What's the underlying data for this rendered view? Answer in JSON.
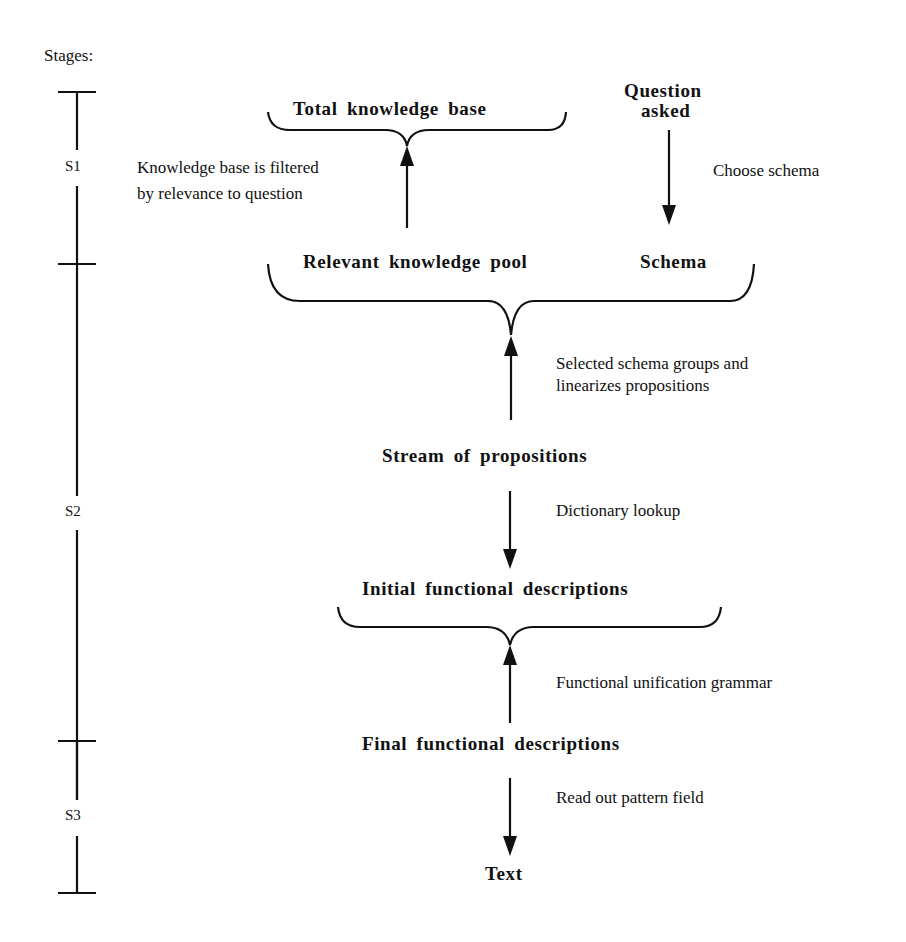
{
  "diagram": {
    "stages_heading": "Stages:",
    "stages": [
      {
        "label": "S1"
      },
      {
        "label": "S2"
      },
      {
        "label": "S3"
      }
    ],
    "nodes": {
      "total_knowledge_base": "Total knowledge base",
      "question_asked_line1": "Question",
      "question_asked_line2": "asked",
      "relevant_knowledge_pool": "Relevant knowledge pool",
      "schema": "Schema",
      "stream_of_propositions": "Stream of propositions",
      "initial_functional_descriptions": "Initial functional descriptions",
      "final_functional_descriptions": "Final functional descriptions",
      "text": "Text"
    },
    "edge_labels": {
      "filter_line1": "Knowledge base is filtered",
      "filter_line2": "by relevance to question",
      "choose_schema": "Choose schema",
      "schema_groups_line1": "Selected schema groups and",
      "schema_groups_line2": "linearizes propositions",
      "dictionary_lookup": "Dictionary lookup",
      "unification_grammar": "Functional unification grammar",
      "read_out": "Read out pattern field"
    },
    "colors": {
      "ink": "#111111",
      "background": "#ffffff"
    }
  }
}
